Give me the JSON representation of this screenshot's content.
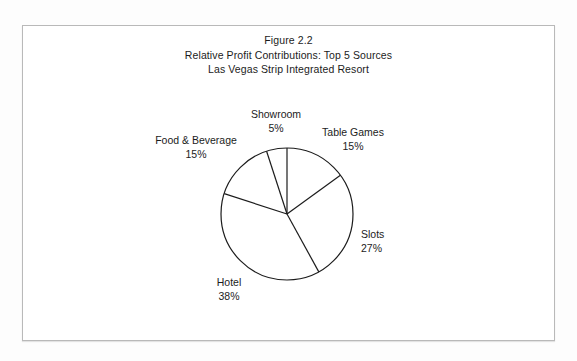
{
  "figure": {
    "title_lines": [
      "Figure 2.2",
      "Relative Profit Contributions: Top 5 Sources",
      "Las Vegas Strip Integrated Resort"
    ],
    "line_color": "#1c1c1c",
    "fill_color": "#ffffff",
    "frame_color": "#b9b9b9",
    "page_background": "#ffffff"
  },
  "chart_data": {
    "type": "pie",
    "xlabel": "",
    "ylabel": "",
    "legend": "none",
    "grid": false,
    "start_angle_deg": 0,
    "direction": "clockwise",
    "categories": [
      "Table Games",
      "Slots",
      "Hotel",
      "Food & Beverage",
      "Showroom"
    ],
    "values": [
      15,
      27,
      38,
      15,
      5
    ],
    "value_unit": "%",
    "slices": [
      {
        "label": "Table Games",
        "value": 15,
        "percent_text": "15%",
        "start_deg": 0,
        "end_deg": 54
      },
      {
        "label": "Slots",
        "value": 27,
        "percent_text": "27%",
        "start_deg": 54,
        "end_deg": 151.2
      },
      {
        "label": "Hotel",
        "value": 38,
        "percent_text": "38%",
        "start_deg": 151.2,
        "end_deg": 288
      },
      {
        "label": "Food & Beverage",
        "value": 15,
        "percent_text": "15%",
        "start_deg": 288,
        "end_deg": 342
      },
      {
        "label": "Showroom",
        "value": 5,
        "percent_text": "5%",
        "start_deg": 342,
        "end_deg": 360
      }
    ]
  }
}
